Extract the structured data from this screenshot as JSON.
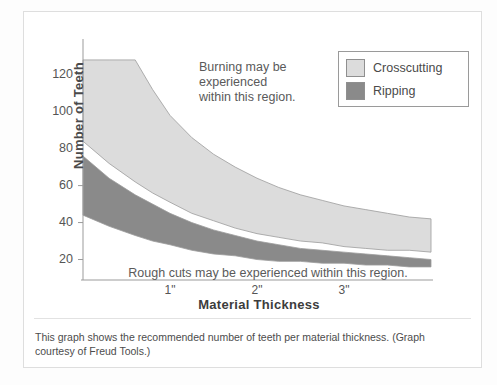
{
  "chart_data": {
    "type": "area",
    "title": "",
    "xlabel": "Material Thickness",
    "ylabel": "Number of Teeth",
    "xticks": [
      "1\"",
      "2\"",
      "3\""
    ],
    "xtick_values": [
      1,
      2,
      3
    ],
    "yticks": [
      "20",
      "40",
      "60",
      "80",
      "100",
      "120"
    ],
    "ytick_values": [
      20,
      40,
      60,
      80,
      100,
      120
    ],
    "xlim": [
      0,
      4
    ],
    "ylim": [
      10,
      135
    ],
    "grid": false,
    "legend_position": "top-right",
    "x": [
      0.0,
      0.3,
      0.6,
      0.8,
      1.0,
      1.25,
      1.5,
      1.75,
      2.0,
      2.25,
      2.5,
      2.75,
      3.0,
      3.25,
      3.5,
      3.75,
      4.0
    ],
    "series": [
      {
        "name": "Crosscutting",
        "color": "#dcdcdc",
        "upper": [
          128,
          128,
          128,
          112,
          98,
          86,
          77,
          70,
          64,
          59,
          55,
          52,
          49,
          47,
          45,
          43,
          42
        ],
        "lower": [
          84,
          72,
          62,
          56,
          51,
          45,
          41,
          37,
          34,
          32,
          30,
          29,
          27,
          26,
          25,
          25,
          24
        ]
      },
      {
        "name": "Ripping",
        "color": "#8a8a8a",
        "upper": [
          76,
          64,
          55,
          50,
          45,
          40,
          36,
          33,
          30,
          28,
          26,
          25,
          24,
          23,
          22,
          21,
          20
        ],
        "lower": [
          44,
          38,
          33,
          30,
          28,
          25,
          23,
          22,
          20,
          19,
          19,
          18,
          18,
          17,
          17,
          16,
          16
        ]
      }
    ],
    "annotations": [
      {
        "name": "burning-note",
        "lines": [
          "Burning may be",
          "experienced",
          "within this region."
        ]
      },
      {
        "name": "rough-cuts-note",
        "text": "Rough cuts may be experienced within this region."
      }
    ]
  },
  "legend": {
    "items": [
      {
        "label": "Crosscutting",
        "color": "#dcdcdc"
      },
      {
        "label": "Ripping",
        "color": "#8a8a8a"
      }
    ]
  },
  "caption": {
    "text": "This graph shows the recommended number of teeth per material thickness. (Graph courtesy of Freud Tools.)"
  }
}
